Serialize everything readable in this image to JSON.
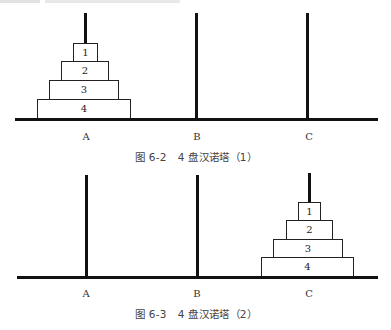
{
  "header_fragment": {
    "text": ""
  },
  "figures": [
    {
      "id": "fig-6-2",
      "caption": "图 6-2   4 盘汉诺塔（1）",
      "pegs": [
        {
          "label": "A",
          "disks": [
            "1",
            "2",
            "3",
            "4"
          ]
        },
        {
          "label": "B",
          "disks": []
        },
        {
          "label": "C",
          "disks": []
        }
      ]
    },
    {
      "id": "fig-6-3",
      "caption": "图 6-3   4 盘汉诺塔（2）",
      "pegs": [
        {
          "label": "A",
          "disks": []
        },
        {
          "label": "B",
          "disks": []
        },
        {
          "label": "C",
          "disks": [
            "1",
            "2",
            "3",
            "4"
          ]
        }
      ]
    }
  ],
  "colors": {
    "line": "#111111",
    "disk_border": "#222222",
    "background": "#ffffff"
  }
}
